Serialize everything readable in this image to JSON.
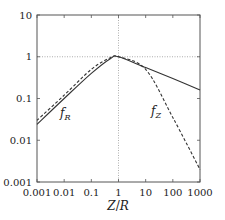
{
  "chart_data": {
    "type": "line",
    "title": "",
    "xlabel": "Z/R",
    "ylabel": "",
    "xscale": "log",
    "yscale": "log",
    "xlim": [
      0.001,
      1000
    ],
    "ylim": [
      0.001,
      10
    ],
    "x_ticks": [
      "0.001",
      "0.01",
      "0.1",
      "1",
      "10",
      "100",
      "1000"
    ],
    "y_ticks": [
      "0.001",
      "0.01",
      "0.1",
      "1",
      "10"
    ],
    "reference_lines": [
      {
        "axis": "x",
        "value": 1,
        "style": "dotted"
      },
      {
        "axis": "y",
        "value": 1,
        "style": "dotted"
      }
    ],
    "grid": false,
    "series": [
      {
        "name": "f_R",
        "style": "solid",
        "x": [
          0.001,
          0.01,
          0.1,
          0.5,
          1,
          10,
          100,
          1000
        ],
        "y": [
          0.024,
          0.1,
          0.4,
          0.9,
          1.0,
          0.55,
          0.3,
          0.16
        ]
      },
      {
        "name": "f_Z",
        "style": "dashed",
        "x": [
          0.001,
          0.01,
          0.1,
          0.5,
          1,
          10,
          100,
          1000
        ],
        "y": [
          0.03,
          0.12,
          0.5,
          0.95,
          1.0,
          0.5,
          0.035,
          0.002
        ]
      }
    ],
    "annotations": [
      {
        "text": "f_R",
        "near_x": 0.005,
        "near_y": 0.05
      },
      {
        "text": "f_Z",
        "near_x": 20,
        "near_y": 0.05
      }
    ]
  },
  "labels": {
    "xlabel_main": "Z",
    "xlabel_slash": "/",
    "xlabel_den": "R",
    "fR_main": "f",
    "fR_sub": "R",
    "fZ_main": "f",
    "fZ_sub": "Z"
  }
}
